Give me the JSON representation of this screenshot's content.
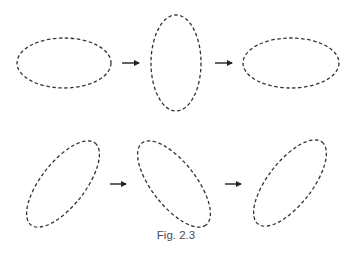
{
  "figure": {
    "caption": "Fig. 2.3",
    "stroke_color": "#333333",
    "dash_pattern": "3.5 2.5",
    "rows": [
      {
        "name": "top-row",
        "ellipses": [
          {
            "cx": 64,
            "cy": 63,
            "rx": 47,
            "ry": 25,
            "rotate": 0
          },
          {
            "cx": 176,
            "cy": 63,
            "rx": 25,
            "ry": 48,
            "rotate": 0
          },
          {
            "cx": 291,
            "cy": 63,
            "rx": 48,
            "ry": 25,
            "rotate": 0
          }
        ],
        "arrows": [
          {
            "x1": 122,
            "x2": 140,
            "y": 63
          },
          {
            "x1": 215,
            "x2": 233,
            "y": 63
          }
        ]
      },
      {
        "name": "bottom-row",
        "ellipses": [
          {
            "cx": 63,
            "cy": 184,
            "rx": 52,
            "ry": 22,
            "rotate": -52
          },
          {
            "cx": 174,
            "cy": 184,
            "rx": 52,
            "ry": 22,
            "rotate": 52
          },
          {
            "cx": 290,
            "cy": 183,
            "rx": 52,
            "ry": 22,
            "rotate": -52
          }
        ],
        "arrows": [
          {
            "x1": 110,
            "x2": 127,
            "y": 184
          },
          {
            "x1": 225,
            "x2": 242,
            "y": 184
          }
        ]
      }
    ]
  }
}
